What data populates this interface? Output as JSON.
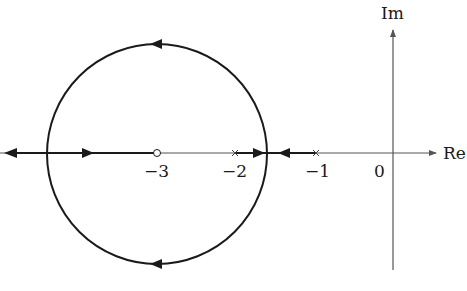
{
  "diagram": {
    "type": "root-locus",
    "axes": {
      "real_label": "Re",
      "imag_label": "Im",
      "origin_label": "0"
    },
    "tick_labels": {
      "minus3": "−3",
      "minus2": "−2",
      "minus1": "−1"
    },
    "poles": [
      -2,
      -1
    ],
    "zeros": [
      -3
    ],
    "breakaway_point_approx": -1.6,
    "circle": {
      "center": -3,
      "passes_through": [
        -1.6,
        -4.4
      ]
    },
    "colors": {
      "line": "#1a1a1a",
      "axis": "#555555"
    }
  }
}
